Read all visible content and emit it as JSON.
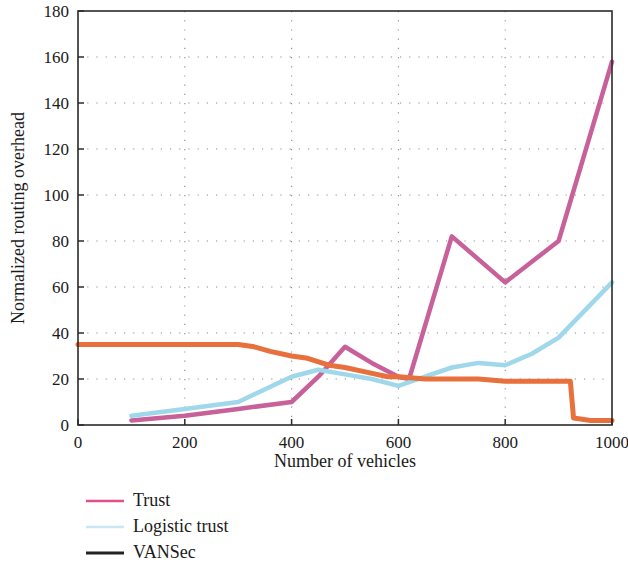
{
  "figure": {
    "background": "#ffffff",
    "frame_color": "#2b2b2b",
    "grid_color": "#8c8c8c"
  },
  "chart_data": {
    "type": "line",
    "title": "",
    "xlabel": "Number of vehicles",
    "ylabel": "Normalized routing overhead",
    "xlim": [
      0,
      1000
    ],
    "ylim": [
      0,
      180
    ],
    "xticks": [
      0,
      200,
      400,
      600,
      800,
      1000
    ],
    "yticks": [
      0,
      20,
      40,
      60,
      80,
      100,
      120,
      140,
      160,
      180
    ],
    "grid": true,
    "grid_style": "dotted",
    "legend_position": "below-left",
    "series": [
      {
        "name": "Trust",
        "color": "#c8619a",
        "legend_color": "#e04f8c",
        "width": 4.5,
        "x": [
          100,
          200,
          300,
          400,
          450,
          500,
          550,
          600,
          620,
          700,
          800,
          900,
          1000
        ],
        "values": [
          2,
          4,
          7,
          10,
          21,
          34,
          27,
          21,
          20,
          82,
          62,
          80,
          158
        ]
      },
      {
        "name": "Logistic trust",
        "color": "#9fd8ea",
        "legend_color": "#c9e7f2",
        "width": 4.5,
        "x": [
          100,
          200,
          300,
          400,
          450,
          500,
          550,
          600,
          650,
          700,
          750,
          800,
          850,
          900,
          1000
        ],
        "values": [
          4,
          7,
          10,
          21,
          24,
          22,
          20,
          17,
          21,
          25,
          27,
          26,
          31,
          38,
          62
        ]
      },
      {
        "name": "VANSec",
        "color": "#e8703c",
        "legend_color": "#222222",
        "width": 5,
        "x": [
          0,
          100,
          200,
          300,
          330,
          360,
          400,
          430,
          470,
          500,
          540,
          580,
          600,
          650,
          700,
          750,
          800,
          860,
          910,
          922,
          928,
          960,
          1000
        ],
        "values": [
          35,
          35,
          35,
          35,
          34,
          32,
          30,
          29,
          26,
          25,
          23,
          21,
          21,
          20,
          20,
          20,
          19,
          19,
          19,
          19,
          3,
          2,
          2
        ]
      }
    ]
  },
  "legend": {
    "items": [
      {
        "label": "Trust",
        "swatch": "#e04f8c"
      },
      {
        "label": "Logistic trust",
        "swatch": "#c9e7f2"
      },
      {
        "label": "VANSec",
        "swatch": "#222222"
      }
    ]
  }
}
